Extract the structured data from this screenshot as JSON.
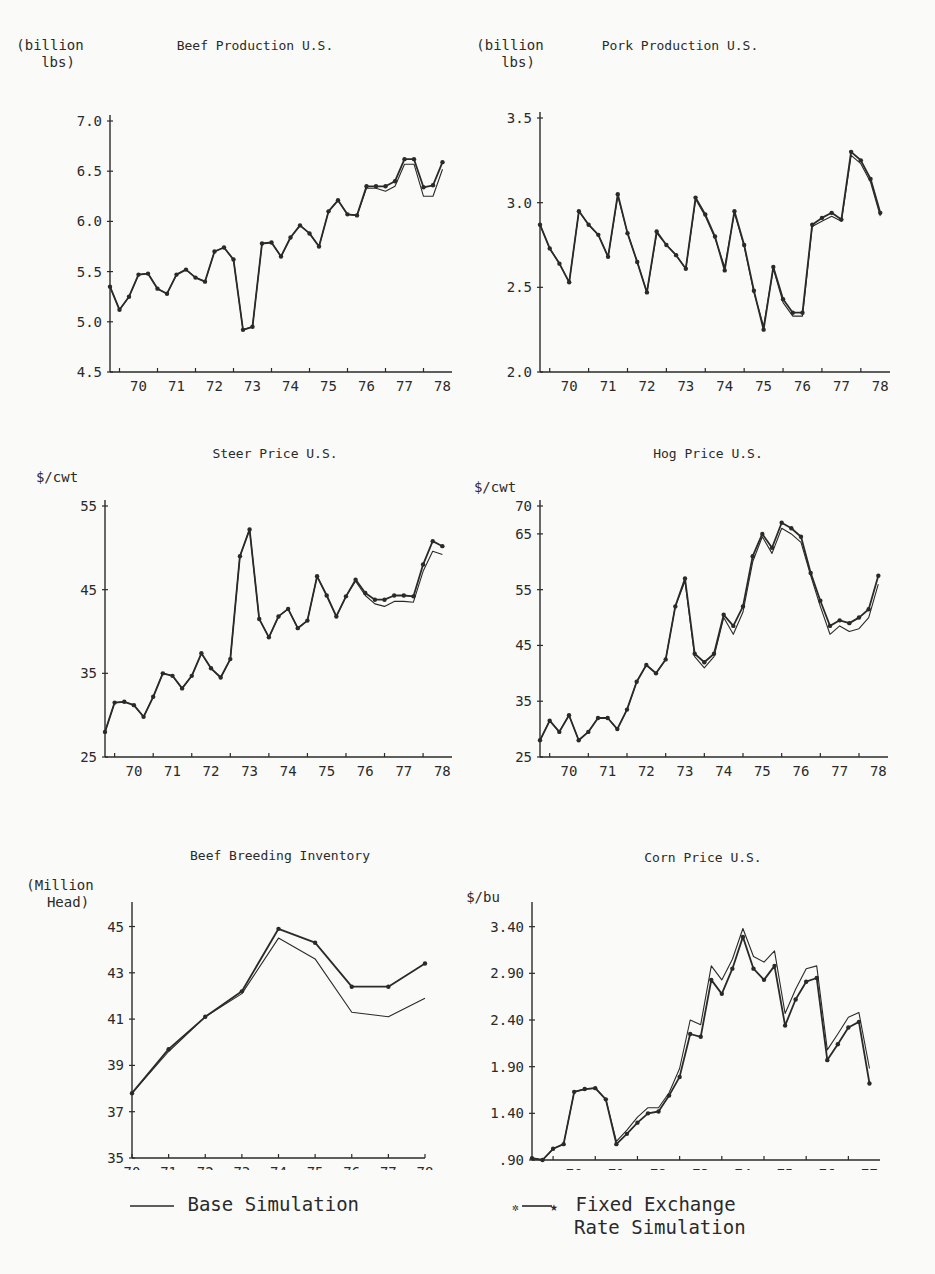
{
  "chart_data": [
    {
      "id": "beef_production",
      "type": "line",
      "title": "Beef Production U.S.",
      "ylabel": "(billion lbs)",
      "ylabel_lines": [
        "(billion",
        "lbs)"
      ],
      "xlabel": "",
      "xticks": [
        "70",
        "71",
        "72",
        "73",
        "74",
        "75",
        "76",
        "77",
        "78"
      ],
      "yticks": [
        4.5,
        5.0,
        5.5,
        6.0,
        6.5,
        7.0
      ],
      "ytick_labels": [
        "4.5",
        "5.0",
        "5.5",
        "6.0",
        "6.5",
        "7.0"
      ],
      "ylim": [
        4.5,
        7.0
      ],
      "xlim": [
        69.75,
        78.75
      ],
      "frequency": "quarterly",
      "x": [
        69.75,
        70.0,
        70.25,
        70.5,
        70.75,
        71.0,
        71.25,
        71.5,
        71.75,
        72.0,
        72.25,
        72.5,
        72.75,
        73.0,
        73.25,
        73.5,
        73.75,
        74.0,
        74.25,
        74.5,
        74.75,
        75.0,
        75.25,
        75.5,
        75.75,
        76.0,
        76.25,
        76.5,
        76.75,
        77.0,
        77.25,
        77.5,
        77.75,
        78.0,
        78.25,
        78.5
      ],
      "series": [
        {
          "name": "Base Simulation",
          "values": [
            5.35,
            5.12,
            5.25,
            5.47,
            5.48,
            5.33,
            5.28,
            5.47,
            5.52,
            5.44,
            5.4,
            5.7,
            5.74,
            5.62,
            4.92,
            4.95,
            5.78,
            5.79,
            5.65,
            5.84,
            5.96,
            5.88,
            5.75,
            6.1,
            6.21,
            6.07,
            6.06,
            6.33,
            6.33,
            6.3,
            6.35,
            6.57,
            6.57,
            6.25,
            6.25,
            6.52,
            6.53
          ]
        },
        {
          "name": "Fixed Exchange Rate Simulation",
          "values": [
            5.35,
            5.12,
            5.25,
            5.47,
            5.48,
            5.33,
            5.28,
            5.47,
            5.52,
            5.44,
            5.4,
            5.7,
            5.74,
            5.62,
            4.92,
            4.95,
            5.78,
            5.79,
            5.65,
            5.84,
            5.96,
            5.88,
            5.75,
            6.1,
            6.21,
            6.07,
            6.06,
            6.35,
            6.35,
            6.35,
            6.4,
            6.62,
            6.62,
            6.34,
            6.36,
            6.59,
            6.6
          ]
        }
      ]
    },
    {
      "id": "pork_production",
      "type": "line",
      "title": "Pork Production U.S.",
      "ylabel": "(billion lbs)",
      "ylabel_lines": [
        "(billion",
        "lbs)"
      ],
      "xlabel": "",
      "xticks": [
        "70",
        "71",
        "72",
        "73",
        "74",
        "75",
        "76",
        "77",
        "78"
      ],
      "yticks": [
        2.0,
        2.5,
        3.0,
        3.5
      ],
      "ytick_labels": [
        "2.0",
        "2.5",
        "3.0",
        "3.5"
      ],
      "ylim": [
        2.0,
        3.5
      ],
      "xlim": [
        69.75,
        78.75
      ],
      "frequency": "quarterly",
      "x": [
        69.75,
        70.0,
        70.25,
        70.5,
        70.75,
        71.0,
        71.25,
        71.5,
        71.75,
        72.0,
        72.25,
        72.5,
        72.75,
        73.0,
        73.25,
        73.5,
        73.75,
        74.0,
        74.25,
        74.5,
        74.75,
        75.0,
        75.25,
        75.5,
        75.75,
        76.0,
        76.25,
        76.5,
        76.75,
        77.0,
        77.25,
        77.5,
        77.75,
        78.0,
        78.25,
        78.5
      ],
      "series": [
        {
          "name": "Base Simulation",
          "values": [
            2.87,
            2.73,
            2.64,
            2.53,
            2.95,
            2.87,
            2.81,
            2.68,
            3.04,
            2.82,
            2.65,
            2.47,
            2.82,
            2.75,
            2.69,
            2.61,
            3.02,
            2.92,
            2.79,
            2.62,
            2.94,
            2.74,
            2.47,
            2.27,
            2.61,
            2.41,
            2.33,
            2.33,
            2.86,
            2.89,
            2.92,
            2.89,
            3.28,
            3.23,
            3.12,
            2.92,
            3.24
          ]
        },
        {
          "name": "Fixed Exchange Rate Simulation",
          "values": [
            2.87,
            2.73,
            2.64,
            2.53,
            2.95,
            2.87,
            2.81,
            2.68,
            3.05,
            2.82,
            2.65,
            2.47,
            2.83,
            2.75,
            2.69,
            2.61,
            3.03,
            2.93,
            2.8,
            2.6,
            2.95,
            2.75,
            2.48,
            2.25,
            2.62,
            2.43,
            2.35,
            2.35,
            2.87,
            2.91,
            2.94,
            2.9,
            3.3,
            3.25,
            3.14,
            2.94,
            3.24
          ]
        }
      ]
    },
    {
      "id": "steer_price",
      "type": "line",
      "title": "Steer Price U.S.",
      "ylabel": "$/cwt",
      "ylabel_lines": [
        "$/cwt"
      ],
      "xlabel": "",
      "xticks": [
        "70",
        "71",
        "72",
        "73",
        "74",
        "75",
        "76",
        "77",
        "78"
      ],
      "yticks": [
        25,
        35,
        45,
        55
      ],
      "ytick_labels": [
        "25",
        "35",
        "45",
        "55"
      ],
      "ylim": [
        25,
        55
      ],
      "xlim": [
        69.75,
        78.75
      ],
      "frequency": "quarterly",
      "x": [
        69.75,
        70.0,
        70.25,
        70.5,
        70.75,
        71.0,
        71.25,
        71.5,
        71.75,
        72.0,
        72.25,
        72.5,
        72.75,
        73.0,
        73.25,
        73.5,
        73.75,
        74.0,
        74.25,
        74.5,
        74.75,
        75.0,
        75.25,
        75.5,
        75.75,
        76.0,
        76.25,
        76.5,
        76.75,
        77.0,
        77.25,
        77.5,
        77.75,
        78.0,
        78.25,
        78.5
      ],
      "series": [
        {
          "name": "Base Simulation",
          "values": [
            28.0,
            31.5,
            31.6,
            31.2,
            29.8,
            32.2,
            35.0,
            34.7,
            33.2,
            34.7,
            37.4,
            35.6,
            34.5,
            36.7,
            49.0,
            52.2,
            41.5,
            39.3,
            41.8,
            42.7,
            40.4,
            41.3,
            46.6,
            44.3,
            41.8,
            44.2,
            46.0,
            44.3,
            43.3,
            43.0,
            43.6,
            43.6,
            43.5,
            47.2,
            49.6,
            49.2,
            48.8
          ]
        },
        {
          "name": "Fixed Exchange Rate Simulation",
          "values": [
            28.0,
            31.5,
            31.6,
            31.2,
            29.8,
            32.2,
            35.0,
            34.7,
            33.2,
            34.7,
            37.4,
            35.6,
            34.5,
            36.7,
            49.0,
            52.2,
            41.5,
            39.3,
            41.8,
            42.7,
            40.4,
            41.3,
            46.6,
            44.3,
            41.8,
            44.2,
            46.2,
            44.6,
            43.8,
            43.8,
            44.3,
            44.3,
            44.2,
            48.0,
            50.8,
            50.2,
            49.7
          ]
        }
      ]
    },
    {
      "id": "hog_price",
      "type": "line",
      "title": "Hog Price U.S.",
      "ylabel": "$/cwt",
      "ylabel_lines": [
        "$/cwt"
      ],
      "xlabel": "",
      "xticks": [
        "70",
        "71",
        "72",
        "73",
        "74",
        "75",
        "76",
        "77",
        "78"
      ],
      "yticks": [
        25,
        35,
        45,
        55,
        65,
        70
      ],
      "ytick_labels": [
        "25",
        "35",
        "45",
        "55",
        "65",
        "70"
      ],
      "ylim": [
        25,
        70
      ],
      "xlim": [
        69.75,
        78.75
      ],
      "frequency": "quarterly",
      "x": [
        69.75,
        70.0,
        70.25,
        70.5,
        70.75,
        71.0,
        71.25,
        71.5,
        71.75,
        72.0,
        72.25,
        72.5,
        72.75,
        73.0,
        73.25,
        73.5,
        73.75,
        74.0,
        74.25,
        74.5,
        74.75,
        75.0,
        75.25,
        75.5,
        75.75,
        76.0,
        76.25,
        76.5,
        76.75,
        77.0,
        77.25,
        77.5,
        77.75,
        78.0,
        78.25,
        78.5
      ],
      "series": [
        {
          "name": "Base Simulation",
          "values": [
            28.0,
            31.5,
            29.5,
            32.5,
            28.0,
            29.5,
            32.0,
            32.0,
            30.0,
            33.5,
            38.5,
            41.5,
            40.0,
            42.5,
            52.0,
            56.5,
            43.0,
            41.0,
            43.0,
            50.0,
            47.0,
            51.0,
            60.0,
            64.5,
            61.5,
            66.0,
            65.0,
            63.5,
            57.5,
            52.0,
            47.0,
            48.5,
            47.5,
            48.0,
            50.0,
            56.0,
            56.5
          ]
        },
        {
          "name": "Fixed Exchange Rate Simulation",
          "values": [
            28.0,
            31.5,
            29.5,
            32.5,
            28.0,
            29.5,
            32.0,
            32.0,
            30.0,
            33.5,
            38.5,
            41.5,
            40.0,
            42.5,
            52.0,
            57.0,
            43.5,
            42.0,
            43.5,
            50.5,
            48.5,
            52.0,
            61.0,
            65.0,
            62.5,
            67.0,
            66.0,
            64.5,
            58.0,
            53.0,
            48.5,
            49.5,
            49.0,
            50.0,
            51.5,
            57.5,
            58.0
          ]
        }
      ]
    },
    {
      "id": "beef_breeding_inventory",
      "type": "line",
      "title": "Beef Breeding Inventory",
      "ylabel": "(Million Head)",
      "ylabel_lines": [
        "(Million",
        "Head)"
      ],
      "xlabel": "",
      "xticks": [
        "70",
        "71",
        "72",
        "73",
        "74",
        "75",
        "76",
        "77",
        "78"
      ],
      "yticks": [
        35,
        37,
        39,
        41,
        43,
        45
      ],
      "ytick_labels": [
        "35",
        "37",
        "39",
        "41",
        "43",
        "45"
      ],
      "ylim": [
        35,
        45.8
      ],
      "xlim": [
        70,
        78
      ],
      "frequency": "annual",
      "x": [
        70,
        71,
        72,
        73,
        74,
        75,
        76,
        77,
        78
      ],
      "series": [
        {
          "name": "Base Simulation",
          "values": [
            37.8,
            39.6,
            41.1,
            42.1,
            44.5,
            43.6,
            41.3,
            41.1,
            41.9
          ]
        },
        {
          "name": "Fixed Exchange Rate Simulation",
          "values": [
            37.8,
            39.7,
            41.1,
            42.2,
            44.9,
            44.3,
            42.4,
            42.4,
            43.4
          ]
        }
      ]
    },
    {
      "id": "corn_price",
      "type": "line",
      "title": "Corn Price U.S.",
      "ylabel": "$/bu",
      "ylabel_lines": [
        "$/bu"
      ],
      "xlabel": "",
      "xticks": [
        "70",
        "71",
        "72",
        "73",
        "74",
        "75",
        "76",
        "77"
      ],
      "yticks": [
        0.9,
        1.4,
        1.9,
        2.4,
        2.9,
        3.4
      ],
      "ytick_labels": [
        ".90",
        "1.40",
        "1.90",
        "2.40",
        "2.90",
        "3.40"
      ],
      "ylim": [
        0.9,
        3.6
      ],
      "xlim": [
        69.5,
        77.75
      ],
      "frequency": "quarterly",
      "x": [
        69.5,
        69.75,
        70.0,
        70.25,
        70.5,
        70.75,
        71.0,
        71.25,
        71.5,
        71.75,
        72.0,
        72.25,
        72.5,
        72.75,
        73.0,
        73.25,
        73.5,
        73.75,
        74.0,
        74.25,
        74.5,
        74.75,
        75.0,
        75.25,
        75.5,
        75.75,
        76.0,
        76.25,
        76.5,
        76.75,
        77.0,
        77.25,
        77.5
      ],
      "series": [
        {
          "name": "Base Simulation",
          "values": [
            0.92,
            0.9,
            1.02,
            1.07,
            1.63,
            1.66,
            1.67,
            1.55,
            1.1,
            1.22,
            1.36,
            1.46,
            1.46,
            1.62,
            1.88,
            2.4,
            2.35,
            2.98,
            2.83,
            3.05,
            3.38,
            3.08,
            3.02,
            3.14,
            2.47,
            2.73,
            2.95,
            2.98,
            2.08,
            2.25,
            2.43,
            2.48,
            1.88
          ]
        },
        {
          "name": "Fixed Exchange Rate Simulation",
          "values": [
            0.92,
            0.9,
            1.02,
            1.07,
            1.63,
            1.66,
            1.67,
            1.55,
            1.07,
            1.18,
            1.3,
            1.4,
            1.42,
            1.59,
            1.79,
            2.25,
            2.22,
            2.83,
            2.68,
            2.95,
            3.29,
            2.95,
            2.83,
            2.98,
            2.34,
            2.62,
            2.81,
            2.85,
            1.97,
            2.14,
            2.32,
            2.38,
            1.72
          ]
        }
      ]
    }
  ],
  "legend": {
    "base": {
      "label": "Base Simulation",
      "symbol": "plain line"
    },
    "fixed_line1": "Fixed Exchange",
    "fixed_line2": "Rate Simulation",
    "fixed": {
      "label": "Fixed Exchange Rate Simulation",
      "symbol": "line with star markers"
    }
  },
  "colors": {
    "ink": "#2a2a2a",
    "paper": "#fafaf8"
  }
}
